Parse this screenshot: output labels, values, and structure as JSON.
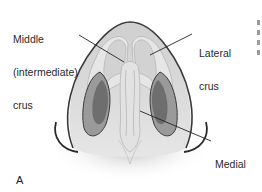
{
  "figure": {
    "panel_label": "A",
    "labels": {
      "middle_crus_line1": "Middle",
      "middle_crus_line2": "(intermediate)",
      "middle_crus_line3": "crus",
      "lateral_crus_line1": "Lateral",
      "lateral_crus_line2": "crus",
      "medial_crus_line1": "Medial",
      "medial_crus_line2": "crus"
    },
    "colors": {
      "skin": "#d9d9d9",
      "outline": "#3a3a3a",
      "cartilage": "#e8e8e8",
      "nostril_dark": "#6e6e6e",
      "nostril_mid": "#9a9a9a",
      "leader_line": "#222222",
      "shadow": "#c8c8c8"
    }
  }
}
